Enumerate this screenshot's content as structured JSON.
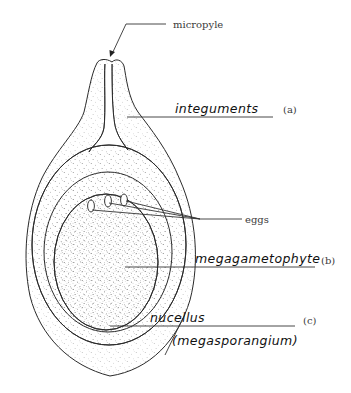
{
  "figure": {
    "labels": {
      "micropyle": "micropyle",
      "integuments": "integuments",
      "integuments_tag": "(a)",
      "eggs": "eggs",
      "megagametophyte": "megagametophyte",
      "megagametophyte_tag": "(b)",
      "nucellus": "nucellus",
      "nucellus_sub": "(megasporangium)",
      "nucellus_tag": "(c)"
    },
    "colors": {
      "line": "#2a2a2a",
      "stipple": "#9a9a9a",
      "background": "#ffffff"
    }
  }
}
